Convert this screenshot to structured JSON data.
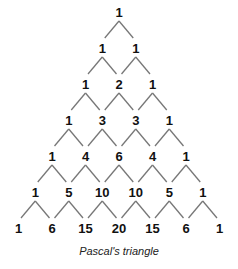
{
  "title": "Pascal's triangle",
  "rows": [
    [
      1
    ],
    [
      1,
      1
    ],
    [
      1,
      2,
      1
    ],
    [
      1,
      3,
      3,
      1
    ],
    [
      1,
      4,
      6,
      4,
      1
    ],
    [
      1,
      5,
      10,
      10,
      5,
      1
    ],
    [
      1,
      6,
      15,
      20,
      15,
      6,
      1
    ]
  ],
  "layout": {
    "center_x": 119,
    "top_y": 12,
    "row_gap": 36,
    "col_gap": 33.5
  },
  "colors": {
    "text": "#111111",
    "line": "#777777"
  }
}
